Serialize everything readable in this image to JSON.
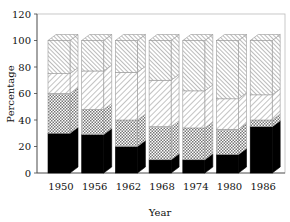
{
  "chart_data": {
    "type": "bar",
    "stacked": true,
    "style": "3d-stacked-column",
    "title": "",
    "xlabel": "Year",
    "ylabel": "Percentage",
    "ylim": [
      0,
      120
    ],
    "yticks": [
      0,
      20,
      40,
      60,
      80,
      100,
      120
    ],
    "categories": [
      "1950",
      "1956",
      "1962",
      "1968",
      "1974",
      "1980",
      "1986"
    ],
    "series": [
      {
        "name": "Segment 1 (solid black)",
        "pattern": "solid-black",
        "values": [
          30,
          29,
          20,
          10,
          10,
          14,
          35
        ]
      },
      {
        "name": "Segment 2 (cross-hatch)",
        "pattern": "crosshatch",
        "values": [
          30,
          19,
          20,
          25,
          24,
          19,
          5
        ]
      },
      {
        "name": "Segment 3 (light diagonal hatch)",
        "pattern": "diagonal-light",
        "values": [
          15,
          29,
          36,
          35,
          28,
          23,
          19
        ]
      },
      {
        "name": "Segment 4 (dense diagonal hatch)",
        "pattern": "diagonal-dense",
        "values": [
          25,
          23,
          24,
          30,
          38,
          44,
          41
        ]
      }
    ],
    "grid": false,
    "legend": null
  },
  "axes": {
    "x_title": "Year",
    "y_title": "Percentage"
  }
}
